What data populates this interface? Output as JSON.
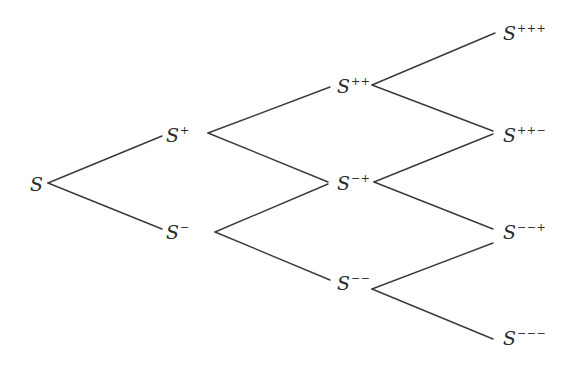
{
  "diagram": {
    "type": "binomial-tree",
    "base_symbol": "S",
    "nodes": [
      {
        "id": "n0",
        "label": "S",
        "sup": "",
        "x": 30,
        "y": 184
      },
      {
        "id": "n1u",
        "label": "S",
        "sup": "+",
        "x": 166,
        "y": 135
      },
      {
        "id": "n1d",
        "label": "S",
        "sup": "−",
        "x": 166,
        "y": 232
      },
      {
        "id": "n2uu",
        "label": "S",
        "sup": "++",
        "x": 337,
        "y": 86
      },
      {
        "id": "n2ud",
        "label": "S",
        "sup": "−+",
        "x": 337,
        "y": 183
      },
      {
        "id": "n2dd",
        "label": "S",
        "sup": "−−",
        "x": 337,
        "y": 283
      },
      {
        "id": "n3a",
        "label": "S",
        "sup": "+++",
        "x": 503,
        "y": 33
      },
      {
        "id": "n3b",
        "label": "S",
        "sup": "++−",
        "x": 503,
        "y": 135
      },
      {
        "id": "n3c",
        "label": "S",
        "sup": "−−+",
        "x": 503,
        "y": 232
      },
      {
        "id": "n3d",
        "label": "S",
        "sup": "−−−",
        "x": 503,
        "y": 338
      }
    ],
    "edges": [
      {
        "from": "n0",
        "to": "n1u",
        "x1": 48,
        "y1": 183,
        "x2": 162,
        "y2": 136
      },
      {
        "from": "n0",
        "to": "n1d",
        "x1": 48,
        "y1": 183,
        "x2": 162,
        "y2": 229
      },
      {
        "from": "n1u",
        "to": "n2uu",
        "x1": 208,
        "y1": 133,
        "x2": 330,
        "y2": 87
      },
      {
        "from": "n1u",
        "to": "n2ud",
        "x1": 208,
        "y1": 133,
        "x2": 328,
        "y2": 182
      },
      {
        "from": "n1d",
        "to": "n2ud",
        "x1": 215,
        "y1": 232,
        "x2": 328,
        "y2": 184
      },
      {
        "from": "n1d",
        "to": "n2dd",
        "x1": 215,
        "y1": 232,
        "x2": 330,
        "y2": 280
      },
      {
        "from": "n2uu",
        "to": "n3a",
        "x1": 372,
        "y1": 85,
        "x2": 495,
        "y2": 33
      },
      {
        "from": "n2uu",
        "to": "n3b",
        "x1": 372,
        "y1": 85,
        "x2": 493,
        "y2": 131
      },
      {
        "from": "n2ud",
        "to": "n3b",
        "x1": 374,
        "y1": 182,
        "x2": 493,
        "y2": 134
      },
      {
        "from": "n2ud",
        "to": "n3c",
        "x1": 374,
        "y1": 182,
        "x2": 493,
        "y2": 229
      },
      {
        "from": "n2dd",
        "to": "n3c",
        "x1": 372,
        "y1": 289,
        "x2": 493,
        "y2": 243
      },
      {
        "from": "n2dd",
        "to": "n3d",
        "x1": 372,
        "y1": 289,
        "x2": 493,
        "y2": 339
      }
    ],
    "colors": {
      "line": "#3a3a3a",
      "text": "#2b2b2b",
      "background": "#ffffff"
    }
  }
}
